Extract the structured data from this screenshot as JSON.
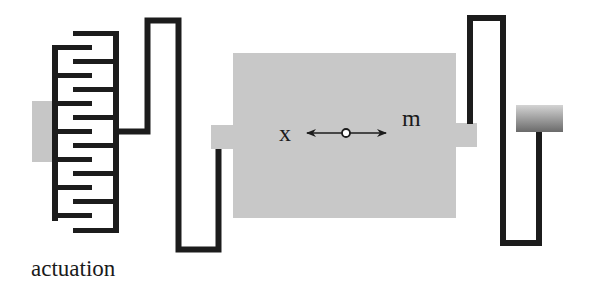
{
  "diagram": {
    "type": "mems-resonator-schematic",
    "labels": {
      "actuation": "actuation",
      "displacement": "x",
      "mass": "m"
    },
    "colors": {
      "line": "#1c1c1c",
      "mass_fill": "#c8c8c8",
      "anchor_fill": "#c6c6c6",
      "anchor_gradient_top": "#d2d2d2",
      "anchor_gradient_bottom": "#6e6e6e",
      "background": "#ffffff"
    },
    "components": [
      {
        "name": "comb-drive-actuator",
        "label": "actuation"
      },
      {
        "name": "left-folded-spring"
      },
      {
        "name": "proof-mass",
        "label": "m"
      },
      {
        "name": "displacement-arrow",
        "label": "x"
      },
      {
        "name": "right-folded-spring"
      },
      {
        "name": "right-anchor"
      }
    ]
  }
}
